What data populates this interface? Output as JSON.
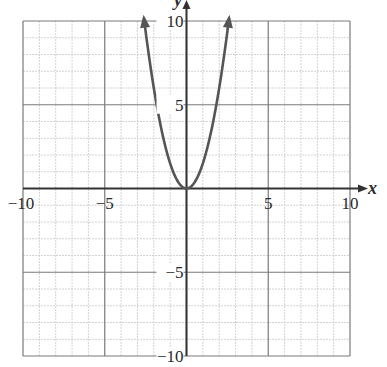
{
  "chart_data": {
    "type": "line",
    "title": "",
    "xlabel": "x",
    "ylabel": "y",
    "xlim": [
      -10,
      10
    ],
    "ylim": [
      -10,
      10
    ],
    "grid": true,
    "grid_minor_step": 1,
    "grid_major_step": 5,
    "x_ticks": [
      {
        "value": -10,
        "label": "−10"
      },
      {
        "value": -5,
        "label": "−5"
      },
      {
        "value": 5,
        "label": "5"
      },
      {
        "value": 10,
        "label": "10"
      }
    ],
    "y_ticks": [
      {
        "value": 10,
        "label": "10"
      },
      {
        "value": 5,
        "label": "5"
      },
      {
        "value": -5,
        "label": "−5"
      },
      {
        "value": -10,
        "label": "−10"
      }
    ],
    "series": [
      {
        "name": "parabola",
        "equation": "y ≈ 1.5x²",
        "x_range": [
          -2.6,
          2.6
        ],
        "arrows_at_ends": true,
        "points": [
          {
            "x": -2.6,
            "y": 10.1
          },
          {
            "x": -2,
            "y": 6
          },
          {
            "x": -1.8,
            "y": 4.9
          },
          {
            "x": -1,
            "y": 1.5
          },
          {
            "x": 0,
            "y": 0
          },
          {
            "x": 1,
            "y": 1.5
          },
          {
            "x": 1.8,
            "y": 4.9
          },
          {
            "x": 2,
            "y": 6
          },
          {
            "x": 2.6,
            "y": 10.1
          }
        ],
        "color": "#555555"
      }
    ],
    "legend": null
  },
  "colors": {
    "curve": "#555555",
    "axis": "#333333",
    "major_grid": "#7a7a7a",
    "minor_grid": "#c8c8c8"
  }
}
